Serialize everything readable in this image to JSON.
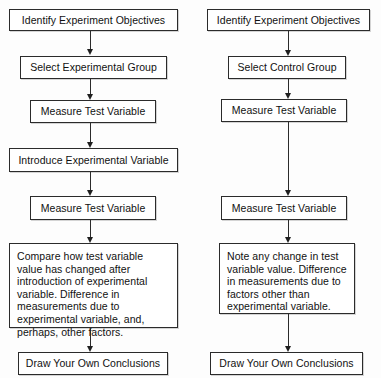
{
  "diagram": {
    "background_color": "#fdfdfd",
    "box_border_color": "#2b2b2b",
    "arrow_color": "#1f1f1f",
    "text_color": "#111111"
  },
  "left_column": {
    "name": "experimental-group-branch",
    "nodes": [
      {
        "id": "l1",
        "label": "Identify Experiment Objectives"
      },
      {
        "id": "l2",
        "label": "Select Experimental Group"
      },
      {
        "id": "l3",
        "label": "Measure Test Variable"
      },
      {
        "id": "l4",
        "label": "Introduce Experimental Variable"
      },
      {
        "id": "l5",
        "label": "Measure Test Variable"
      },
      {
        "id": "l6",
        "label": "Compare how test variable value has changed after introduction of experimental variable. Difference in measurements due to experimental variable, and, perhaps, other factors."
      },
      {
        "id": "l7",
        "label": "Draw Your Own Conclusions"
      }
    ]
  },
  "right_column": {
    "name": "control-group-branch",
    "nodes": [
      {
        "id": "r1",
        "label": "Identify Experiment Objectives"
      },
      {
        "id": "r2",
        "label": "Select  Control Group"
      },
      {
        "id": "r3",
        "label": "Measure Test Variable"
      },
      {
        "id": "r4",
        "label": "Measure Test Variable"
      },
      {
        "id": "r5",
        "label": "Note any change in test variable value.  Difference in measurements due to factors other than experimental variable."
      },
      {
        "id": "r6",
        "label": "Draw Your Own Conclusions"
      }
    ]
  },
  "connectors": {
    "left": [
      {
        "name": "arrow-l1-l2"
      },
      {
        "name": "arrow-l2-l3"
      },
      {
        "name": "arrow-l3-l4"
      },
      {
        "name": "arrow-l4-l5"
      },
      {
        "name": "arrow-l5-l6"
      },
      {
        "name": "arrow-l6-l7"
      }
    ],
    "right": [
      {
        "name": "arrow-r1-r2"
      },
      {
        "name": "arrow-r2-r3"
      },
      {
        "name": "arrow-r3-r4"
      },
      {
        "name": "arrow-r4-r5"
      },
      {
        "name": "arrow-r5-r6"
      }
    ]
  }
}
